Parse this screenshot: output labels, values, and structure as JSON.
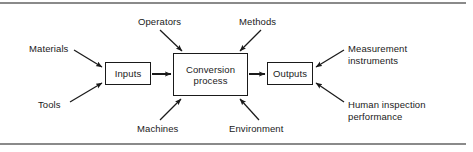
{
  "figure": {
    "type": "process-flow-diagram",
    "colors": {
      "stroke": "#1a1a1a",
      "rule": "#8a8a8a",
      "background": "#ffffff"
    }
  },
  "rules": {
    "top_label": "top-horizontal-rule",
    "bottom_label": "bottom-horizontal-rule"
  },
  "nodes": {
    "inputs": "Inputs",
    "conversion": "Conversion\nprocess",
    "outputs": "Outputs"
  },
  "labels": {
    "materials": "Materials",
    "tools": "Tools",
    "operators": "Operators",
    "methods": "Methods",
    "machines": "Machines",
    "environment": "Environment",
    "measurement_instruments": "Measurement\ninstruments",
    "human_inspection": "Human inspection\nperformance"
  },
  "arrows": [
    {
      "name": "materials-to-inputs",
      "from": "Materials",
      "to": "Inputs"
    },
    {
      "name": "tools-to-inputs",
      "from": "Tools",
      "to": "Inputs"
    },
    {
      "name": "inputs-to-conversion",
      "from": "Inputs",
      "to": "Conversion process"
    },
    {
      "name": "operators-to-conversion",
      "from": "Operators",
      "to": "Conversion process"
    },
    {
      "name": "methods-to-conversion",
      "from": "Methods",
      "to": "Conversion process"
    },
    {
      "name": "machines-to-conversion",
      "from": "Machines",
      "to": "Conversion process"
    },
    {
      "name": "environment-to-conversion",
      "from": "Environment",
      "to": "Conversion process"
    },
    {
      "name": "conversion-to-outputs",
      "from": "Conversion process",
      "to": "Outputs"
    },
    {
      "name": "measurement-to-outputs",
      "from": "Measurement instruments",
      "to": "Outputs"
    },
    {
      "name": "human-inspection-to-outputs",
      "from": "Human inspection performance",
      "to": "Outputs"
    }
  ]
}
